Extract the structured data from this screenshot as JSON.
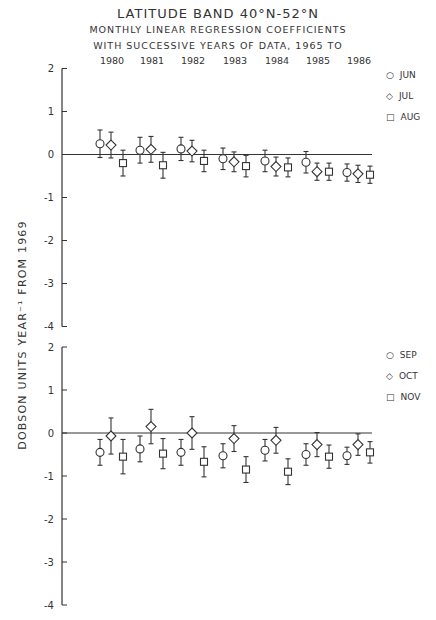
{
  "chart_data": [
    {
      "type": "scatter",
      "title": "LATITUDE BAND 40°N-52°N",
      "subtitle": "MONTHLY LINEAR REGRESSION COEFFICIENTS WITH SUCCESSIVE YEARS OF DATA, 1965 TO",
      "xlabel": "",
      "ylabel": "DOBSON UNITS YEAR⁻¹ FROM 1969",
      "categories": [
        "1980",
        "1981",
        "1982",
        "1983",
        "1984",
        "1985",
        "1986"
      ],
      "ylim": [
        -4,
        2
      ],
      "yticks": [
        2,
        1,
        0,
        -1,
        -2,
        -3,
        -4
      ],
      "error_bars": true,
      "legend_position": "right",
      "series": [
        {
          "name": "JUN",
          "marker": "circle",
          "values": [
            0.25,
            0.1,
            0.13,
            -0.1,
            -0.15,
            -0.18,
            -0.42
          ],
          "error": [
            0.32,
            0.3,
            0.27,
            0.25,
            0.25,
            0.25,
            0.2
          ]
        },
        {
          "name": "JUL",
          "marker": "diamond",
          "values": [
            0.22,
            0.12,
            0.08,
            -0.17,
            -0.28,
            -0.4,
            -0.45
          ],
          "error": [
            0.3,
            0.3,
            0.25,
            0.23,
            0.22,
            0.2,
            0.2
          ]
        },
        {
          "name": "AUG",
          "marker": "square",
          "values": [
            -0.2,
            -0.25,
            -0.15,
            -0.27,
            -0.3,
            -0.4,
            -0.47
          ],
          "error": [
            0.3,
            0.3,
            0.25,
            0.25,
            0.22,
            0.2,
            0.2
          ]
        }
      ]
    },
    {
      "type": "scatter",
      "title": "",
      "xlabel": "",
      "ylabel": "DOBSON UNITS YEAR⁻¹ FROM 1969",
      "categories": [
        "1980",
        "1981",
        "1982",
        "1983",
        "1984",
        "1985",
        "1986"
      ],
      "ylim": [
        -4,
        2
      ],
      "yticks": [
        2,
        1,
        0,
        -1,
        -2,
        -3,
        -4
      ],
      "error_bars": true,
      "legend_position": "right",
      "series": [
        {
          "name": "SEP",
          "marker": "circle",
          "values": [
            -0.45,
            -0.37,
            -0.45,
            -0.53,
            -0.4,
            -0.5,
            -0.53
          ],
          "error": [
            0.3,
            0.3,
            0.3,
            0.28,
            0.25,
            0.25,
            0.2
          ]
        },
        {
          "name": "OCT",
          "marker": "diamond",
          "values": [
            -0.07,
            0.15,
            0.0,
            -0.13,
            -0.17,
            -0.27,
            -0.27
          ],
          "error": [
            0.42,
            0.4,
            0.38,
            0.3,
            0.3,
            0.28,
            0.25
          ]
        },
        {
          "name": "NOV",
          "marker": "square",
          "values": [
            -0.55,
            -0.48,
            -0.67,
            -0.85,
            -0.9,
            -0.55,
            -0.45
          ],
          "error": [
            0.4,
            0.35,
            0.35,
            0.3,
            0.3,
            0.27,
            0.25
          ]
        }
      ]
    }
  ],
  "header": {
    "title": "LATITUDE BAND 40°N-52°N",
    "line2": "MONTHLY LINEAR REGRESSION COEFFICIENTS",
    "line3": "WITH SUCCESSIVE YEARS OF DATA, 1965 TO",
    "years": [
      "1980",
      "1981",
      "1982",
      "1983",
      "1984",
      "1985",
      "1986"
    ]
  },
  "axis": {
    "ylabel": "DOBSON UNITS YEAR⁻¹ FROM 1969",
    "ticks": [
      "2",
      "1",
      "0",
      "-1",
      "-2",
      "-3",
      "-4"
    ]
  },
  "legend_top": [
    "JUN",
    "JUL",
    "AUG"
  ],
  "legend_bottom": [
    "SEP",
    "OCT",
    "NOV"
  ],
  "colors": {
    "ink": "#333333",
    "background": "#ffffff"
  }
}
